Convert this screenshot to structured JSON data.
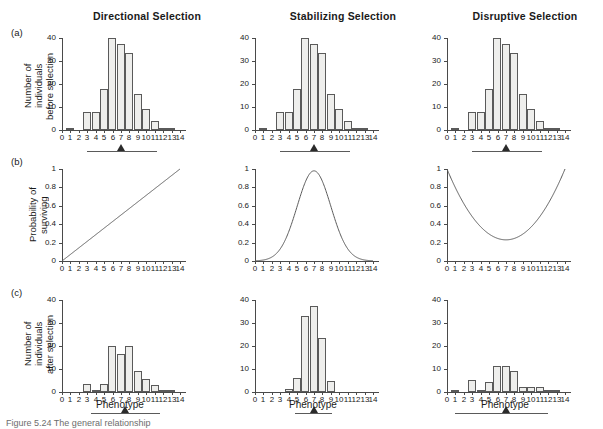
{
  "figure": {
    "row_tags": [
      "(a)",
      "(b)",
      "(c)"
    ],
    "column_titles": [
      "Directional Selection",
      "Stabilizing Selection",
      "Disruptive Selection"
    ],
    "y_axis_titles": {
      "row_a_line1": "Number of",
      "row_a_line2": "individuals",
      "row_a_line3": "before selection",
      "row_b_line1": "Probability of",
      "row_b_line2": "surviving",
      "row_c_line1": "Number of",
      "row_c_line2": "individuals",
      "row_c_line3": "after selection"
    },
    "x_axis_caption": "Phenotype",
    "caption": "Figure 5.24  The general relationship"
  },
  "chart_data": [
    {
      "id": "a-directional",
      "type": "bar",
      "title": "Directional Selection",
      "row": "(a)",
      "xlabel": "Phenotype",
      "ylabel": "Number of individuals before selection",
      "categories": [
        0,
        1,
        2,
        3,
        4,
        5,
        6,
        7,
        8,
        9,
        10,
        11,
        12,
        13,
        14
      ],
      "values": [
        0,
        1,
        0,
        9,
        9,
        20,
        45,
        42,
        37.5,
        17.5,
        10.5,
        4.5,
        0.5,
        0.5,
        0
      ],
      "xlim": [
        0,
        14
      ],
      "ylim": [
        0,
        45
      ],
      "yticks": [
        0,
        10,
        20,
        30,
        40
      ],
      "grid": false,
      "range_bar": {
        "from": 3,
        "to": 11.3
      },
      "mean_marker": 7.0
    },
    {
      "id": "a-stabilizing",
      "type": "bar",
      "title": "Stabilizing Selection",
      "row": "(a)",
      "xlabel": "Phenotype",
      "ylabel": "Number of individuals before selection",
      "categories": [
        0,
        1,
        2,
        3,
        4,
        5,
        6,
        7,
        8,
        9,
        10,
        11,
        12,
        13,
        14
      ],
      "values": [
        0,
        1,
        0,
        9,
        9,
        20,
        45,
        42,
        37.5,
        17.5,
        10.5,
        4.5,
        0.5,
        0.5,
        0
      ],
      "xlim": [
        0,
        14
      ],
      "ylim": [
        0,
        45
      ],
      "yticks": [
        0,
        10,
        20,
        30,
        40
      ],
      "grid": false,
      "range_bar": {
        "from": 3,
        "to": 11.3
      },
      "mean_marker": 7.0
    },
    {
      "id": "a-disruptive",
      "type": "bar",
      "title": "Disruptive Selection",
      "row": "(a)",
      "xlabel": "Phenotype",
      "ylabel": "Number of individuals before selection",
      "categories": [
        0,
        1,
        2,
        3,
        4,
        5,
        6,
        7,
        8,
        9,
        10,
        11,
        12,
        13,
        14
      ],
      "values": [
        0,
        1,
        0,
        9,
        9,
        20,
        45,
        42,
        37.5,
        17.5,
        10.5,
        4.5,
        0.5,
        0.5,
        0
      ],
      "xlim": [
        0,
        14
      ],
      "ylim": [
        0,
        45
      ],
      "yticks": [
        0,
        10,
        20,
        30,
        40
      ],
      "grid": false,
      "range_bar": {
        "from": 3,
        "to": 11.3
      },
      "mean_marker": 7.0
    },
    {
      "id": "b-directional",
      "type": "line",
      "row": "(b)",
      "shape": "linear-increasing",
      "xlabel": "Phenotype",
      "ylabel": "Probability of surviving",
      "xlim": [
        0,
        14
      ],
      "ylim": [
        0,
        1
      ],
      "yticks": [
        0,
        0.2,
        0.4,
        0.6,
        0.8,
        1
      ],
      "ytick_labels": [
        "0",
        "0.2",
        "0.4",
        "0.6",
        "0.8",
        "1"
      ],
      "x": [
        0,
        1,
        2,
        3,
        4,
        5,
        6,
        7,
        8,
        9,
        10,
        11,
        12,
        13,
        14
      ],
      "values": [
        0,
        0.071,
        0.143,
        0.214,
        0.286,
        0.357,
        0.429,
        0.5,
        0.571,
        0.643,
        0.714,
        0.786,
        0.857,
        0.929,
        1.0
      ],
      "grid": false
    },
    {
      "id": "b-stabilizing",
      "type": "line",
      "row": "(b)",
      "shape": "gaussian-peak",
      "xlabel": "Phenotype",
      "ylabel": "Probability of surviving",
      "xlim": [
        0,
        14
      ],
      "ylim": [
        0,
        1
      ],
      "yticks": [
        0,
        0.2,
        0.4,
        0.6,
        0.8,
        1
      ],
      "ytick_labels": [
        "0",
        "0.2",
        "0.4",
        "0.6",
        "0.8",
        "1"
      ],
      "peak_x": 7,
      "peak_y": 0.98,
      "sigma": 2.0,
      "x": [
        0,
        1,
        2,
        3,
        4,
        5,
        6,
        7,
        8,
        9,
        10,
        11,
        12,
        13,
        14
      ],
      "values": [
        0.007,
        0.023,
        0.068,
        0.166,
        0.334,
        0.554,
        0.824,
        0.98,
        0.824,
        0.554,
        0.334,
        0.166,
        0.068,
        0.023,
        0.007
      ],
      "grid": false
    },
    {
      "id": "b-disruptive",
      "type": "line",
      "row": "(b)",
      "shape": "u-curve",
      "xlabel": "Phenotype",
      "ylabel": "Probability of surviving",
      "xlim": [
        0,
        14
      ],
      "ylim": [
        0,
        1
      ],
      "yticks": [
        0,
        0.2,
        0.4,
        0.6,
        0.8,
        1
      ],
      "ytick_labels": [
        "0",
        "0.2",
        "0.4",
        "0.6",
        "0.8",
        "1"
      ],
      "min_x": 7,
      "min_y": 0.23,
      "x": [
        0,
        1,
        2,
        3,
        4,
        5,
        6,
        7,
        8,
        9,
        10,
        11,
        12,
        13,
        14
      ],
      "values": [
        1.0,
        0.76,
        0.56,
        0.41,
        0.31,
        0.255,
        0.232,
        0.23,
        0.238,
        0.27,
        0.34,
        0.46,
        0.62,
        0.8,
        0.99
      ],
      "grid": false
    },
    {
      "id": "c-directional",
      "type": "bar",
      "row": "(c)",
      "xlabel": "Phenotype",
      "ylabel": "Number of individuals after selection",
      "categories": [
        0,
        1,
        2,
        3,
        4,
        5,
        6,
        7,
        8,
        9,
        10,
        11,
        12,
        13,
        14
      ],
      "values": [
        0,
        0,
        0,
        4,
        1,
        4,
        22.5,
        18.5,
        22.5,
        10.5,
        6.5,
        3.2,
        0.5,
        0.5,
        0
      ],
      "xlim": [
        0,
        14
      ],
      "ylim": [
        0,
        45
      ],
      "yticks": [
        0,
        10,
        20,
        30,
        40
      ],
      "grid": false,
      "range_bar": {
        "from": 3.4,
        "to": 11.6
      },
      "mean_marker": 7.5
    },
    {
      "id": "c-stabilizing",
      "type": "bar",
      "row": "(c)",
      "xlabel": "Phenotype",
      "ylabel": "Number of individuals after selection",
      "categories": [
        0,
        1,
        2,
        3,
        4,
        5,
        6,
        7,
        8,
        9,
        10,
        11,
        12,
        13,
        14
      ],
      "values": [
        0,
        0,
        0,
        0,
        1.5,
        7,
        37,
        42,
        26.5,
        5.5,
        0,
        0,
        0,
        0,
        0
      ],
      "xlim": [
        0,
        14
      ],
      "ylim": [
        0,
        45
      ],
      "yticks": [
        0,
        10,
        20,
        30,
        40
      ],
      "grid": false,
      "range_bar": {
        "from": 4.8,
        "to": 9.2
      },
      "mean_marker": 7.0
    },
    {
      "id": "c-disruptive",
      "type": "bar",
      "row": "(c)",
      "xlabel": "Phenotype",
      "ylabel": "Number of individuals after selection",
      "categories": [
        0,
        1,
        2,
        3,
        4,
        5,
        6,
        7,
        8,
        9,
        10,
        11,
        12,
        13,
        14
      ],
      "values": [
        0,
        1,
        0,
        6,
        0.7,
        5,
        12.5,
        12.5,
        10.5,
        2.3,
        2.3,
        2.3,
        0.5,
        0.5,
        0
      ],
      "xlim": [
        0,
        14
      ],
      "ylim": [
        0,
        45
      ],
      "yticks": [
        0,
        10,
        20,
        30,
        40
      ],
      "grid": false,
      "range_bar": {
        "from": 1.0,
        "to": 12.0
      },
      "mean_marker": 7.0
    }
  ],
  "colors": {
    "bar_fill": "#eeeeec",
    "bar_stroke": "#5a5a5a",
    "axis": "#4a4a4a",
    "curve": "#5a5a5a",
    "text": "#1a1a1a",
    "caption": "#6d6d6d"
  }
}
